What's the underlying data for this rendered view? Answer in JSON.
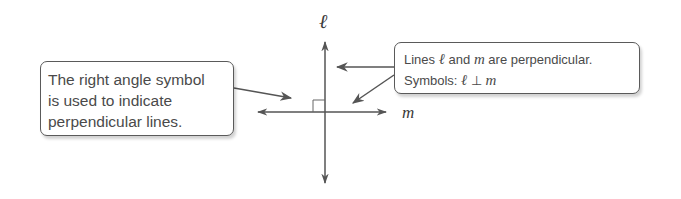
{
  "diagram": {
    "title": "Perpendicular lines",
    "lines": {
      "vertical": {
        "label": "ℓ"
      },
      "horizontal": {
        "label": "m"
      }
    },
    "right_angle_symbol": "square",
    "callouts": {
      "left": {
        "lines": [
          "The right angle symbol",
          "is used to indicate",
          "perpendicular lines."
        ]
      },
      "right": {
        "line1": {
          "before": "Lines ",
          "var1": "ℓ",
          "mid": " and ",
          "var2": "m",
          "after": " are perpendicular."
        },
        "line2": {
          "before": "Symbols: ",
          "var1": "ℓ",
          "symbol": " ⊥ ",
          "var2": "m"
        }
      }
    },
    "colors": {
      "line": "#555555",
      "text": "#4a4a4a",
      "border": "#5a5a5a"
    }
  }
}
